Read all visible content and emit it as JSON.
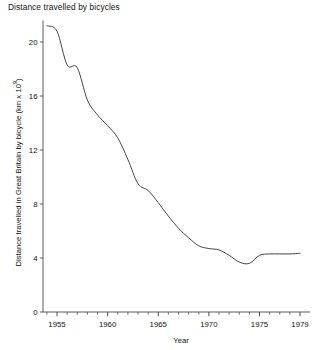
{
  "chart_data": {
    "type": "line",
    "title": "Distance travelled by bicycles",
    "xlabel": "Year",
    "ylabel": "Distance travelled in Great Britain by bicycle (km x 10⁹)",
    "ylabel_prefix": "Distance travelled in Great Britain by bicycle (km x 10",
    "ylabel_exponent": "9",
    "ylabel_suffix": ")",
    "xlim": [
      1954,
      1979
    ],
    "ylim": [
      0,
      21.6
    ],
    "grid": false,
    "legend": null,
    "line_color": "#3a3a3a",
    "axis_color": "#4a4a4a",
    "x_ticks_major": [
      "1955",
      "1960",
      "1965",
      "1970",
      "1975",
      "1979"
    ],
    "x_ticks_major_values": [
      1955,
      1960,
      1965,
      1970,
      1975,
      1979
    ],
    "x_ticks_minor_values": [
      1954,
      1956,
      1957,
      1958,
      1959,
      1961,
      1962,
      1963,
      1964,
      1966,
      1967,
      1968,
      1969,
      1971,
      1972,
      1973,
      1974,
      1976,
      1977,
      1978
    ],
    "y_ticks": [
      "0",
      "4",
      "8",
      "12",
      "16",
      "20"
    ],
    "y_ticks_values": [
      0,
      4,
      8,
      12,
      16,
      20
    ],
    "x": [
      1954,
      1955,
      1956,
      1957,
      1958,
      1959,
      1960,
      1961,
      1962,
      1963,
      1964,
      1965,
      1966,
      1967,
      1968,
      1969,
      1970,
      1971,
      1972,
      1973,
      1974,
      1975,
      1976,
      1977,
      1978,
      1979
    ],
    "values": [
      21.2,
      20.8,
      18.3,
      18.1,
      15.7,
      14.6,
      13.8,
      12.9,
      11.3,
      9.5,
      9.0,
      8.1,
      7.1,
      6.2,
      5.5,
      4.9,
      4.7,
      4.6,
      4.2,
      3.7,
      3.6,
      4.2,
      4.3,
      4.3,
      4.3,
      4.35
    ],
    "series": [
      {
        "name": "Distance travelled by bicycles",
        "values": [
          21.2,
          20.8,
          18.3,
          18.1,
          15.7,
          14.6,
          13.8,
          12.9,
          11.3,
          9.5,
          9.0,
          8.1,
          7.1,
          6.2,
          5.5,
          4.9,
          4.7,
          4.6,
          4.2,
          3.7,
          3.6,
          4.2,
          4.3,
          4.3,
          4.3,
          4.35
        ]
      }
    ]
  }
}
